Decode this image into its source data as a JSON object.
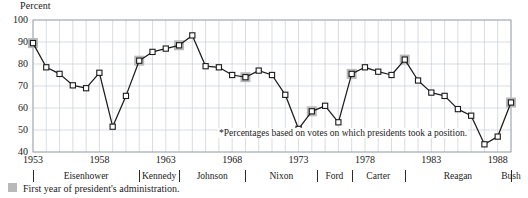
{
  "axis": {
    "y_title": "Percent",
    "y_ticks": [
      "100",
      "90",
      "80",
      "70",
      "60",
      "50",
      "40"
    ],
    "x_ticks": [
      "1953",
      "1958",
      "1963",
      "1968",
      "1973",
      "1978",
      "1983",
      "1988"
    ]
  },
  "footnote": "*Percentages based on votes on which presidents took a position.",
  "legend": {
    "swatch_color": "#b9b9b9",
    "text": "First year of president's administration."
  },
  "presidents": [
    {
      "name": "Eisenhower",
      "start": 1953,
      "end": 1960
    },
    {
      "name": "Kennedy",
      "start": 1961,
      "end": 1963
    },
    {
      "name": "Johnson",
      "start": 1964,
      "end": 1968
    },
    {
      "name": "Nixon",
      "start": 1969,
      "end": 1974
    },
    {
      "name": "Ford",
      "start": 1974,
      "end": 1976
    },
    {
      "name": "Carter",
      "start": 1977,
      "end": 1980
    },
    {
      "name": "Reagan",
      "start": 1981,
      "end": 1988
    },
    {
      "name": "Bush",
      "start": 1989,
      "end": 1989
    }
  ],
  "chart_data": {
    "type": "line",
    "title": "",
    "xlabel": "",
    "ylabel": "Percent",
    "xlim": [
      1953,
      1989
    ],
    "ylim": [
      40,
      100
    ],
    "ytick_step": 10,
    "xtick_step": 5,
    "grid": true,
    "legend_position": "bottom-left",
    "marker": "open-square",
    "line_color": "#1a1a1a",
    "highlight_color": "#b9b9b9",
    "series_name": "Presidential success on congressional votes",
    "x": [
      1953,
      1954,
      1955,
      1956,
      1957,
      1958,
      1959,
      1960,
      1961,
      1962,
      1963,
      1964,
      1965,
      1966,
      1967,
      1968,
      1969,
      1970,
      1971,
      1972,
      1973,
      1974,
      1975,
      1976,
      1977,
      1978,
      1979,
      1980,
      1981,
      1982,
      1983,
      1984,
      1985,
      1986,
      1987,
      1988,
      1989
    ],
    "values": [
      89.5,
      78.5,
      75.5,
      70.3,
      69.0,
      76.0,
      51.5,
      65.5,
      81.5,
      85.5,
      87.0,
      88.5,
      93.0,
      79.0,
      78.5,
      75.0,
      74.0,
      77.0,
      75.0,
      66.0,
      50.5,
      58.5,
      61.0,
      53.5,
      75.5,
      78.5,
      76.5,
      75.0,
      82.0,
      72.5,
      67.0,
      65.5,
      59.5,
      56.5,
      43.5,
      47.0,
      62.5
    ],
    "first_year_points": [
      1953,
      1961,
      1964,
      1969,
      1974,
      1977,
      1981,
      1989
    ]
  }
}
